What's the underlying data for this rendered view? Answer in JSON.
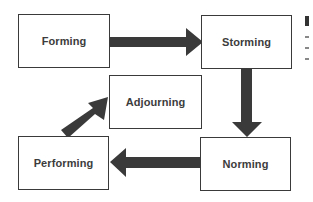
{
  "diagram": {
    "type": "flowchart",
    "nodes": [
      {
        "id": "forming",
        "label": "Forming"
      },
      {
        "id": "storming",
        "label": "Storming"
      },
      {
        "id": "norming",
        "label": "Norming"
      },
      {
        "id": "performing",
        "label": "Performing"
      },
      {
        "id": "adjourning",
        "label": "Adjourning"
      }
    ],
    "edges": [
      {
        "from": "forming",
        "to": "storming"
      },
      {
        "from": "storming",
        "to": "norming"
      },
      {
        "from": "norming",
        "to": "performing"
      },
      {
        "from": "performing",
        "to": "adjourning"
      }
    ],
    "colors": {
      "arrow": "#3a3a3a",
      "border": "#3a3a3a",
      "text": "#3c3c3c",
      "background": "#ffffff"
    }
  }
}
